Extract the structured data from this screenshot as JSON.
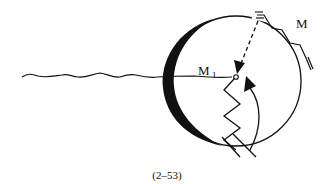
{
  "figure": {
    "caption": "(2–53)",
    "labels": {
      "active_site": "M",
      "active_site_subscript": "1",
      "monomer": "M"
    },
    "elements": [
      "catalyst-particle-sphere",
      "shaded-crescent-left",
      "polymer-chain-wavy",
      "active-site-M1",
      "approaching-monomer-M",
      "dashed-approach-arrow",
      "growing-chain-zigzag",
      "insertion-curved-arrow"
    ],
    "colors": {
      "ink": "#111111",
      "background": "#ffffff"
    }
  }
}
